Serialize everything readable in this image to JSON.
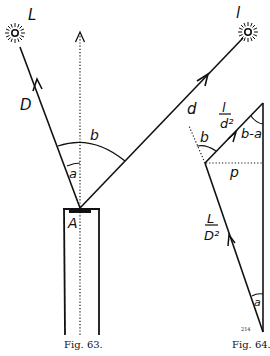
{
  "figure_63": {
    "caption": "Fig. 63.",
    "source_L_label": "L",
    "source_l_label": "l",
    "distance_D_label": "D",
    "distance_d_label": "d",
    "angle_a_label": "a",
    "angle_b_label": "b",
    "point_A_label": "A"
  },
  "figure_64": {
    "caption": "Fig. 64.",
    "vector_l_over_d2_num": "l",
    "vector_l_over_d2_den": "d²",
    "vector_L_over_D2_num": "L",
    "vector_L_over_D2_den": "D²",
    "angle_b_minus_a_label": "b-a",
    "angle_b_label": "b",
    "angle_a_label": "a",
    "p_label": "p",
    "small_mark": "214"
  },
  "colors": {
    "ink": "#111111",
    "background": "#ffffff"
  }
}
